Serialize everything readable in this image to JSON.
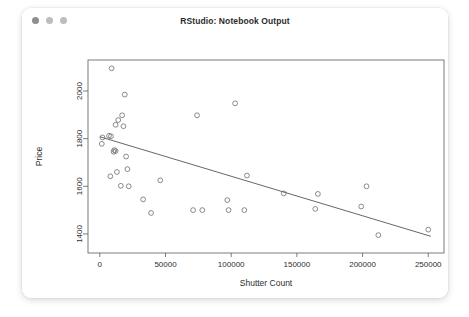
{
  "window": {
    "title": "RStudio: Notebook Output",
    "controls": [
      {
        "name": "close-button",
        "color": "#8e8e8e"
      },
      {
        "name": "minimize-button",
        "color": "#bdbdbd"
      },
      {
        "name": "maximize-button",
        "color": "#bdbdbd"
      }
    ]
  },
  "chart_data": {
    "type": "scatter",
    "title": "",
    "xlabel": "Shutter Count",
    "ylabel": "Price",
    "xlim": [
      -9000,
      262000
    ],
    "ylim": [
      1320,
      2130
    ],
    "xticks": [
      0,
      50000,
      100000,
      150000,
      200000,
      250000
    ],
    "xticklabels": [
      "0",
      "50000",
      "100000",
      "150000",
      "200000",
      "250000"
    ],
    "yticks": [
      1400,
      1600,
      1800,
      2000
    ],
    "yticklabels": [
      "1400",
      "1600",
      "1800",
      "2000"
    ],
    "grid": false,
    "legend": false,
    "marker": "open-circle",
    "point_color": "#6d6d6d",
    "line_color": "#555555",
    "frame": true,
    "points": [
      {
        "x": 9000,
        "y": 2095
      },
      {
        "x": 19000,
        "y": 1985
      },
      {
        "x": 14000,
        "y": 1878
      },
      {
        "x": 17000,
        "y": 1898
      },
      {
        "x": 12000,
        "y": 1858
      },
      {
        "x": 18000,
        "y": 1852
      },
      {
        "x": 2000,
        "y": 1805
      },
      {
        "x": 7000,
        "y": 1812
      },
      {
        "x": 8500,
        "y": 1810
      },
      {
        "x": 1500,
        "y": 1778
      },
      {
        "x": 11000,
        "y": 1752
      },
      {
        "x": 12000,
        "y": 1748
      },
      {
        "x": 10500,
        "y": 1745
      },
      {
        "x": 20000,
        "y": 1725
      },
      {
        "x": 8000,
        "y": 1642
      },
      {
        "x": 13000,
        "y": 1660
      },
      {
        "x": 21000,
        "y": 1672
      },
      {
        "x": 16000,
        "y": 1602
      },
      {
        "x": 22000,
        "y": 1600
      },
      {
        "x": 33000,
        "y": 1545
      },
      {
        "x": 39000,
        "y": 1488
      },
      {
        "x": 46000,
        "y": 1625
      },
      {
        "x": 71000,
        "y": 1500
      },
      {
        "x": 78000,
        "y": 1500
      },
      {
        "x": 74000,
        "y": 1898
      },
      {
        "x": 103000,
        "y": 1948
      },
      {
        "x": 97000,
        "y": 1542
      },
      {
        "x": 98000,
        "y": 1500
      },
      {
        "x": 110000,
        "y": 1500
      },
      {
        "x": 112000,
        "y": 1645
      },
      {
        "x": 140000,
        "y": 1570
      },
      {
        "x": 166000,
        "y": 1568
      },
      {
        "x": 164000,
        "y": 1505
      },
      {
        "x": 199000,
        "y": 1515
      },
      {
        "x": 203000,
        "y": 1600
      },
      {
        "x": 212000,
        "y": 1395
      },
      {
        "x": 250000,
        "y": 1418
      }
    ],
    "fit_line": {
      "type": "linear-regression",
      "x_start": 0,
      "y_start": 1808,
      "x_end": 252000,
      "y_end": 1390
    }
  }
}
